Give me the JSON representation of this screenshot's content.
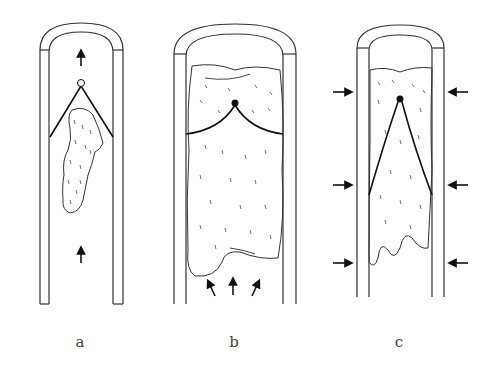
{
  "figure": {
    "panels": [
      {
        "id": "a",
        "label": "a",
        "node": "open-circle",
        "flow_arrows": "upward (top and bottom)"
      },
      {
        "id": "b",
        "label": "b",
        "node": "filled-dot",
        "flow_arrows": "three upward arrows at bottom"
      },
      {
        "id": "c",
        "label": "c",
        "node": "filled-dot",
        "flow_arrows": "inward compression arrows on both sides (3 per side)"
      }
    ]
  },
  "colors": {
    "line": "#222222",
    "wall": "#333333",
    "background": "#ffffff",
    "label": "#444444"
  }
}
